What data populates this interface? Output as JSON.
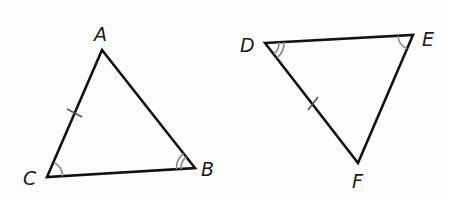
{
  "diagram": {
    "type": "congruent-triangles",
    "triangles": [
      {
        "name": "triangle-ABC",
        "vertices": [
          {
            "label": "A",
            "x": 102,
            "y": 50
          },
          {
            "label": "B",
            "x": 195,
            "y": 168
          },
          {
            "label": "C",
            "x": 47,
            "y": 177
          }
        ],
        "marked_side": "AC",
        "side_tick_count": 1,
        "angle_marks": [
          {
            "vertex": "C",
            "arcs": 1
          },
          {
            "vertex": "B",
            "arcs": 2
          }
        ]
      },
      {
        "name": "triangle-DEF",
        "vertices": [
          {
            "label": "D",
            "x": 265,
            "y": 43
          },
          {
            "label": "E",
            "x": 413,
            "y": 35
          },
          {
            "label": "F",
            "x": 358,
            "y": 163
          }
        ],
        "marked_side": "DF",
        "side_tick_count": 1,
        "angle_marks": [
          {
            "vertex": "E",
            "arcs": 1
          },
          {
            "vertex": "D",
            "arcs": 2
          }
        ]
      }
    ],
    "labels": {
      "A": "A",
      "B": "B",
      "C": "C",
      "D": "D",
      "E": "E",
      "F": "F"
    },
    "colors": {
      "line": "#111111",
      "angle_mark": "#8a8a8a",
      "background": "#fdfdfd"
    }
  }
}
